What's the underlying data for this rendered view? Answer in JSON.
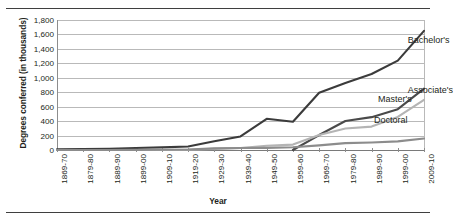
{
  "figure": {
    "xlabel": "Year",
    "ylabel": "Degrees conferred (in thousands)"
  },
  "series_labels": {
    "bachelors": "Bachelor's",
    "associates": "Associate's",
    "masters": "Master's",
    "doctoral": "Doctoral"
  },
  "chart_data": {
    "type": "line",
    "title": "",
    "xlabel": "Year",
    "ylabel": "Degrees conferred (in thousands)",
    "ylim": [
      0,
      1800
    ],
    "ytick_labels": [
      "0",
      "200",
      "400",
      "600",
      "800",
      "1,000",
      "1,200",
      "1,400",
      "1,600",
      "1,800"
    ],
    "ytick_values": [
      0,
      200,
      400,
      600,
      800,
      1000,
      1200,
      1400,
      1600,
      1800
    ],
    "grid": true,
    "legend": "inline-end-of-line",
    "categories": [
      "1869-70",
      "1879-80",
      "1889-90",
      "1899-00",
      "1909-10",
      "1919-20",
      "1929-30",
      "1939-40",
      "1949-50",
      "1959-60",
      "1969-70",
      "1979-80",
      "1989-90",
      "1999-00",
      "2009-10"
    ],
    "series": [
      {
        "name": "Bachelor's",
        "color": "#3b3b3b",
        "values": [
          9,
          13,
          16,
          27,
          37,
          49,
          122,
          187,
          432,
          392,
          792,
          929,
          1052,
          1238,
          1650
        ]
      },
      {
        "name": "Associate's",
        "color": "#4a4a4a",
        "values": [
          0,
          0,
          0,
          0,
          0,
          0,
          0,
          0,
          0,
          0,
          207,
          401,
          455,
          565,
          849
        ]
      },
      {
        "name": "Master's",
        "color": "#b4b4b4",
        "values": [
          0,
          0,
          1,
          1,
          2,
          4,
          15,
          27,
          58,
          75,
          209,
          298,
          324,
          457,
          693
        ]
      },
      {
        "name": "Doctoral",
        "color": "#8c8c8c",
        "values": [
          1,
          1,
          1,
          2,
          4,
          6,
          22,
          27,
          30,
          38,
          64,
          95,
          104,
          119,
          159
        ]
      }
    ]
  }
}
